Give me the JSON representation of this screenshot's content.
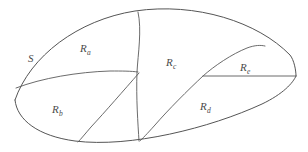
{
  "figure": {
    "kind": "region-subdivision-diagram",
    "background_color": "#ffffff",
    "stroke_color": "#5a5a5a",
    "label_color": "#4a4a4a",
    "outer_region_label": "S",
    "labels": [
      {
        "id": "S",
        "base": "S",
        "sub": "",
        "x": 28,
        "y": 49
      },
      {
        "id": "Ra",
        "base": "R",
        "sub": "a",
        "x": 80,
        "y": 39
      },
      {
        "id": "Rb",
        "base": "R",
        "sub": "b",
        "x": 52,
        "y": 100
      },
      {
        "id": "Rc",
        "base": "R",
        "sub": "c",
        "x": 166,
        "y": 53
      },
      {
        "id": "Rd",
        "base": "R",
        "sub": "d",
        "x": 200,
        "y": 97
      },
      {
        "id": "Re",
        "base": "R",
        "sub": "e",
        "x": 240,
        "y": 58
      }
    ],
    "regions": [
      {
        "id": "Ra",
        "name": "region-ra"
      },
      {
        "id": "Rb",
        "name": "region-rb"
      },
      {
        "id": "Rc",
        "name": "region-rc"
      },
      {
        "id": "Rd",
        "name": "region-rd"
      },
      {
        "id": "Re",
        "name": "region-re"
      }
    ],
    "paths": {
      "outer_top": "M 15,100 C 30,56 78,20 135,11 C 196,2 258,22 290,55 C 294,60 296,70 296,76",
      "outer_bottom": "M 15,100 C 17,120 38,136 75,141 C 130,148 210,128 262,104 C 283,94 293,83 296,76",
      "divider_ab": "M 16,88 C 42,78 78,72 110,71 C 122,71 131,71 138,72",
      "divider_ac": "M 138,12 C 142,30 138,54 137,72 C 136,98 138,124 139,141",
      "divider_bc": "M 139,73 C 124,90 105,112 91,127 C 85,134 81,139 78,142",
      "divider_cd": "M 203,76 C 188,90 168,110 155,125 C 147,134 142,139 140,141",
      "divider_ce": "M 203,76 C 214,66 232,54 247,48 C 255,45 261,45 265,46",
      "divider_de": "M 203,76 L 296,76"
    }
  }
}
